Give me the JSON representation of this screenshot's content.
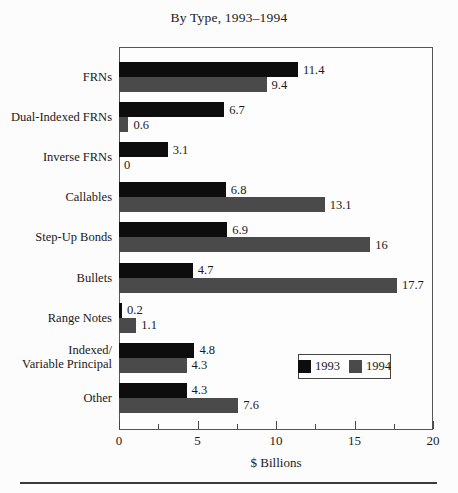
{
  "chart_data": {
    "type": "bar",
    "orientation": "horizontal",
    "title": "By Type, 1993–1994",
    "xlabel": "$ Billions",
    "xlim": [
      0,
      20
    ],
    "x_major_ticks": [
      0,
      5,
      10,
      15,
      20
    ],
    "x_minor_ticks": [
      2.5,
      7.5,
      12.5,
      17.5
    ],
    "grid": false,
    "categories": [
      "FRNs",
      "Dual-Indexed FRNs",
      "Inverse FRNs",
      "Callables",
      "Step-Up Bonds",
      "Bullets",
      "Range Notes",
      "Indexed/\nVariable Principal",
      "Other"
    ],
    "series": [
      {
        "name": "1993",
        "color": "#0d0d0d",
        "values": [
          11.4,
          6.7,
          3.1,
          6.8,
          6.9,
          4.7,
          0.2,
          4.8,
          4.3
        ],
        "labels": [
          "11.4",
          "6.7",
          "3.1",
          "6.8",
          "6.9",
          "4.7",
          "0.2",
          "4.8",
          "4.3"
        ]
      },
      {
        "name": "1994",
        "color": "#4a4a4a",
        "values": [
          9.4,
          0.6,
          0,
          13.1,
          16,
          17.7,
          1.1,
          4.3,
          7.6
        ],
        "labels": [
          "9.4",
          "0.6",
          "0",
          "13.1",
          "16",
          "17.7",
          "1.1",
          "4.3",
          "7.6"
        ]
      }
    ],
    "legend": {
      "position": "inside-right",
      "entries": [
        "1993",
        "1994"
      ]
    }
  },
  "colors": {
    "background": "#fcfcfc",
    "frame": "#555555",
    "text": "#1a1a1a",
    "rule": "#3a3a3a"
  }
}
